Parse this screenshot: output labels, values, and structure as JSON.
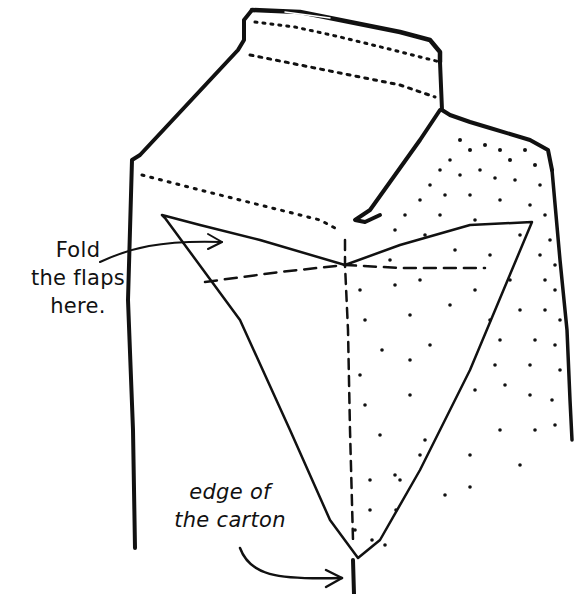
{
  "diagram": {
    "annotations": [
      {
        "id": "fold",
        "lines": [
          "Fold",
          "the flaps",
          "here."
        ]
      },
      {
        "id": "edge",
        "lines": [
          "edge of",
          "the carton"
        ]
      }
    ],
    "colors": {
      "ink": "#111111",
      "background": "#ffffff"
    }
  }
}
